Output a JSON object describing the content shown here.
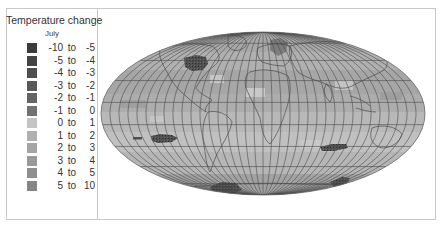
{
  "legend": {
    "title": "Temperature change",
    "subtitle": "July",
    "items": [
      {
        "lo": "-10",
        "to": "to",
        "hi": "-5",
        "color": "#3a3a3a"
      },
      {
        "lo": "-5",
        "to": "to",
        "hi": "-4",
        "color": "#444444"
      },
      {
        "lo": "-4",
        "to": "to",
        "hi": "-3",
        "color": "#4e4e4e"
      },
      {
        "lo": "-3",
        "to": "to",
        "hi": "-2",
        "color": "#585858"
      },
      {
        "lo": "-2",
        "to": "to",
        "hi": "-1",
        "color": "#646464"
      },
      {
        "lo": "-1",
        "to": "to",
        "hi": "0",
        "color": "#727272"
      },
      {
        "lo": "0",
        "to": "to",
        "hi": "1",
        "color": "#c4c4c4"
      },
      {
        "lo": "1",
        "to": "to",
        "hi": "2",
        "color": "#b0b0b0"
      },
      {
        "lo": "2",
        "to": "to",
        "hi": "3",
        "color": "#a4a4a4"
      },
      {
        "lo": "3",
        "to": "to",
        "hi": "4",
        "color": "#999999"
      },
      {
        "lo": "4",
        "to": "to",
        "hi": "5",
        "color": "#8f8f8f"
      },
      {
        "lo": "5",
        "to": "to",
        "hi": "10",
        "color": "#868686"
      }
    ]
  },
  "map": {
    "projection": "mollweide",
    "graticule": {
      "meridian_step_deg": 10,
      "parallel_step_deg": 20
    },
    "colors": {
      "ocean_base": "#b4b4b4",
      "grid_line": "#4a4a4a",
      "coast_line": "#3c3c3c"
    }
  }
}
